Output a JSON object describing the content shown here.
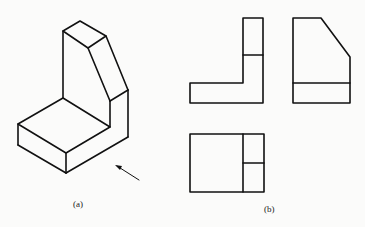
{
  "figure": {
    "labels": {
      "a": "(a)",
      "b": "(b)"
    },
    "colors": {
      "line": "#111111",
      "background": "#fbfbfa"
    },
    "views": {
      "isometric": "isometric-view-of-l-bracket-with-chamfered-upright",
      "front": "front-view",
      "side": "left-side-view",
      "top": "top-view"
    },
    "arrow": "viewing-direction-arrow"
  }
}
